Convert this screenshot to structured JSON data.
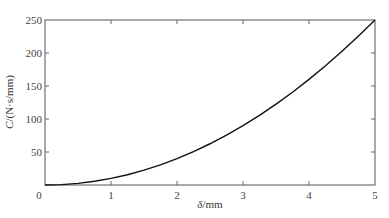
{
  "chart_data": {
    "type": "line",
    "title": "",
    "xlabel_symbol": "δ",
    "xlabel_unit": "/mm",
    "xlabel": "δ/mm",
    "ylabel_symbol": "C",
    "ylabel_unit": "/(N·s/mm)",
    "ylabel": "C/(N·s/mm)",
    "xlim": [
      0,
      5
    ],
    "ylim": [
      0,
      250
    ],
    "xticks": [
      0,
      1,
      2,
      3,
      4,
      5
    ],
    "yticks": [
      0,
      50,
      100,
      150,
      200,
      250
    ],
    "grid": false,
    "legend": null,
    "series": [
      {
        "name": "C",
        "color": "#111111",
        "x": [
          0,
          0.25,
          0.5,
          0.75,
          1,
          1.25,
          1.5,
          1.75,
          2,
          2.25,
          2.5,
          2.75,
          3,
          3.25,
          3.5,
          3.75,
          4,
          4.25,
          4.5,
          4.75,
          5
        ],
        "y": [
          0,
          0.6,
          2.5,
          5.6,
          10,
          15.6,
          22.5,
          30.6,
          40,
          50.6,
          62.5,
          75.6,
          90,
          105.6,
          122.5,
          140.6,
          160,
          180.6,
          202.5,
          225.6,
          250
        ]
      }
    ]
  }
}
